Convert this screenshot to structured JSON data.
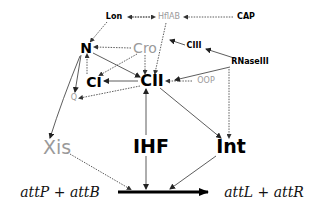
{
  "diagram": {
    "type": "regulatory-network",
    "nodes": {
      "lon": {
        "label": "Lon",
        "style": "bold"
      },
      "hflab": {
        "label": "HflAB",
        "style": "gray"
      },
      "cap": {
        "label": "CAP",
        "style": "bold"
      },
      "n": {
        "label": "N",
        "style": "bold"
      },
      "cro": {
        "label": "Cro",
        "style": "gray"
      },
      "ciii": {
        "label": "CIII",
        "style": "bold"
      },
      "rnaseiii": {
        "label": "RNaseIII",
        "style": "bold"
      },
      "ci": {
        "label": "CI",
        "style": "bold"
      },
      "cii": {
        "label": "CII",
        "style": "bold"
      },
      "oop": {
        "label": "OOP",
        "style": "gray"
      },
      "q": {
        "label": "Q",
        "style": "gray"
      },
      "xis": {
        "label": "Xis",
        "style": "gray"
      },
      "ihf": {
        "label": "IHF",
        "style": "bold"
      },
      "int": {
        "label": "Int",
        "style": "bold"
      }
    },
    "reaction": {
      "left": "attP + attB",
      "right": "attL + attR"
    },
    "edges": [
      {
        "from": "hflab",
        "to": "lon",
        "style": "dashed"
      },
      {
        "from": "lon",
        "to": "hflab",
        "style": "dashed"
      },
      {
        "from": "cap",
        "to": "hflab",
        "style": "dashed"
      },
      {
        "from": "lon",
        "to": "n",
        "style": "dashed"
      },
      {
        "from": "hflab",
        "to": "cii",
        "style": "dashed"
      },
      {
        "from": "cro",
        "to": "n",
        "style": "dashed"
      },
      {
        "from": "cro",
        "to": "ci",
        "style": "dashed"
      },
      {
        "from": "cro",
        "to": "cii",
        "style": "dashed"
      },
      {
        "from": "ciii",
        "to": "hflab",
        "style": "solid"
      },
      {
        "from": "rnaseiii",
        "to": "ciii",
        "style": "solid"
      },
      {
        "from": "rnaseiii",
        "to": "cii",
        "style": "solid"
      },
      {
        "from": "rnaseiii",
        "to": "int",
        "style": "dashed"
      },
      {
        "from": "oop",
        "to": "cii",
        "style": "dashed"
      },
      {
        "from": "n",
        "to": "cii",
        "style": "solid"
      },
      {
        "from": "ci",
        "to": "n",
        "style": "dashed"
      },
      {
        "from": "cii",
        "to": "ci",
        "style": "solid"
      },
      {
        "from": "cii",
        "to": "q",
        "style": "dashed"
      },
      {
        "from": "n",
        "to": "q",
        "style": "solid"
      },
      {
        "from": "n",
        "to": "xis",
        "style": "solid"
      },
      {
        "from": "cii",
        "to": "int",
        "style": "solid"
      },
      {
        "from": "xis",
        "to": "reaction",
        "style": "dashed"
      },
      {
        "from": "ihf",
        "to": "reaction",
        "style": "solid"
      },
      {
        "from": "int",
        "to": "reaction",
        "style": "solid"
      }
    ]
  }
}
